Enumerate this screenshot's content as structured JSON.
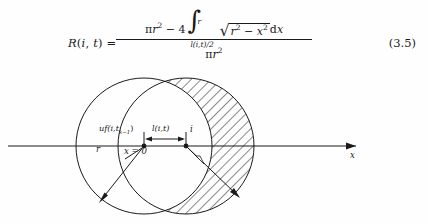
{
  "equation": {
    "tag": "(3.5)",
    "lhs": "R(i, t) =",
    "numerator_text": "πr² − 4 ∫_{l(i,t)/2}^{r} √(r² − x²) dx",
    "denominator_text": "πr²",
    "pi": "π",
    "r_sym": "r",
    "minus": "−",
    "coefficient": "4",
    "integral_sign": "∫",
    "integral_upper": "r",
    "integral_lower": "l(i,t)/2",
    "radical_sign": "√",
    "radicand": "r² − x²",
    "differential": "dx",
    "exponent_two": "2"
  },
  "figure": {
    "labels": {
      "uf": "uf(i,t",
      "uf_sub": "k−1",
      "uf_close": ")",
      "length": "l(i,t)",
      "point_i": "i",
      "origin": "x = 0",
      "radius": "r",
      "axis": "x"
    },
    "geometry": {
      "left_circle_center_x": 144,
      "left_circle_center_y": 84,
      "left_circle_radius": 68,
      "right_circle_center_x": 186,
      "right_circle_center_y": 84,
      "right_circle_radius": 68,
      "axis_y": 84,
      "axis_start_x": 8,
      "axis_end_x": 362,
      "hatch_angle_deg": 45
    },
    "colors": {
      "ink": "#1a1a1a",
      "background": "#ffffff",
      "hatch": "#2a2a2a"
    }
  }
}
